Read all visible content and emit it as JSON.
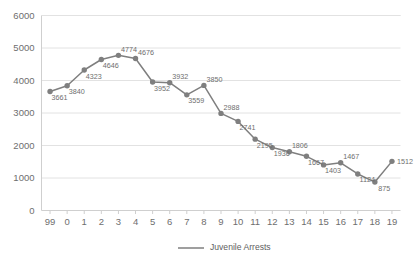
{
  "chart_data": {
    "type": "line",
    "title": "",
    "xlabel": "",
    "ylabel": "",
    "categories": [
      "99",
      "0",
      "1",
      "2",
      "3",
      "4",
      "5",
      "6",
      "7",
      "8",
      "9",
      "10",
      "11",
      "12",
      "13",
      "14",
      "15",
      "16",
      "17",
      "18",
      "19"
    ],
    "values": [
      3661,
      3840,
      4323,
      4646,
      4774,
      4676,
      3952,
      3932,
      3559,
      3850,
      2988,
      2741,
      2195,
      1936,
      1806,
      1667,
      1403,
      1467,
      1124,
      875,
      1512
    ],
    "series": [
      {
        "name": "Juvenile Arrests",
        "values": [
          3661,
          3840,
          4323,
          4646,
          4774,
          4676,
          3952,
          3932,
          3559,
          3850,
          2988,
          2741,
          2195,
          1936,
          1806,
          1667,
          1403,
          1467,
          1124,
          875,
          1512
        ]
      }
    ],
    "point_labels": [
      "3661",
      "3840",
      "4323",
      "4646",
      "4774",
      "4676",
      "3952",
      "3932",
      "3559",
      "3850",
      "2988",
      "2741",
      "2195",
      "1936",
      "1806",
      "1667",
      "1403",
      "1467",
      "1124",
      "875",
      "1512"
    ],
    "ylim": [
      0,
      6000
    ],
    "y_ticks": [
      "0",
      "1000",
      "2000",
      "3000",
      "4000",
      "5000",
      "6000"
    ],
    "y_tick_values": [
      0,
      1000,
      2000,
      3000,
      4000,
      5000,
      6000
    ],
    "grid": "horizontal",
    "legend_position": "bottom",
    "legend": [
      "Juvenile Arrests"
    ],
    "colors": {
      "series": "#7f7f7f",
      "grid": "#e2e2e2",
      "axis": "#cfcfcf",
      "tick_text": "#6e6e6e",
      "label_text": "#6e6e6e",
      "legend_text": "#5e5e5e",
      "background": "#ffffff"
    }
  },
  "legend": {
    "entries": [
      {
        "label": "Juvenile Arrests",
        "swatch": "line-swatch"
      }
    ]
  }
}
